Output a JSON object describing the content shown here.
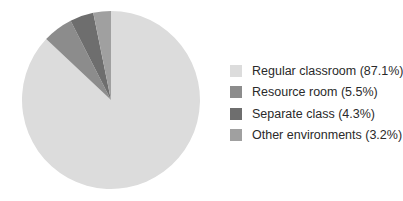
{
  "chart_data": {
    "type": "pie",
    "title": "",
    "start_angle_deg": 0,
    "direction": "clockwise",
    "slices": [
      {
        "label": "Regular classroom",
        "value": 87.1,
        "color": "#dcdcdc"
      },
      {
        "label": "Resource room",
        "value": 5.5,
        "color": "#8c8c8c"
      },
      {
        "label": "Separate class",
        "value": 4.3,
        "color": "#6e6e6e"
      },
      {
        "label": "Other environments",
        "value": 3.2,
        "color": "#a0a0a0"
      }
    ],
    "legend_position": "right"
  },
  "legend": {
    "items": [
      {
        "text": "Regular classroom (87.1%)",
        "color": "#dcdcdc"
      },
      {
        "text": "Resource room (5.5%)",
        "color": "#8c8c8c"
      },
      {
        "text": "Separate class (4.3%)",
        "color": "#6e6e6e"
      },
      {
        "text": "Other environments (3.2%)",
        "color": "#a0a0a0"
      }
    ]
  }
}
